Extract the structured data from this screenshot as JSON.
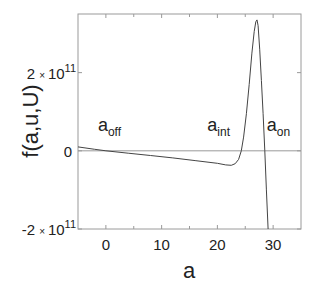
{
  "chart_data": {
    "type": "line",
    "title": "",
    "xlabel": "a",
    "ylabel": "f(a,u,U)",
    "xlim": [
      -5,
      35
    ],
    "ylim": [
      -200000000000.0,
      350000000000.0
    ],
    "grid": false,
    "x_ticks": [
      {
        "value": 0,
        "label": "0"
      },
      {
        "value": 10,
        "label": "10"
      },
      {
        "value": 20,
        "label": "20"
      },
      {
        "value": 30,
        "label": "30"
      }
    ],
    "x_minor_ticks": [
      5,
      15,
      25
    ],
    "y_ticks": [
      {
        "value": 200000000000.0,
        "mantissa": "2",
        "times": "×",
        "base": "10",
        "exp": "11"
      },
      {
        "value": 0,
        "mantissa": "0",
        "times": "",
        "base": "",
        "exp": ""
      },
      {
        "value": -200000000000.0,
        "mantissa": "-2",
        "times": "×",
        "base": "10",
        "exp": "11"
      }
    ],
    "zero_line": true,
    "series": [
      {
        "name": "f(a,u,U)",
        "color": "#444444",
        "x": [
          -5,
          -2,
          0,
          4,
          8,
          12,
          16,
          20,
          21.5,
          22.5,
          23.2,
          23.8,
          24.3,
          24.7,
          25.2,
          25.7,
          26.2,
          26.6,
          26.9,
          27.1,
          27.3,
          27.6,
          27.9,
          28.2,
          28.5,
          28.8,
          29.1
        ],
        "y": [
          10000000000.0,
          4000000000.0,
          0.0,
          -6000000000.0,
          -12000000000.0,
          -18000000000.0,
          -25000000000.0,
          -32000000000.0,
          -36000000000.0,
          -37000000000.0,
          -33000000000.0,
          -22000000000.0,
          0.0,
          35000000000.0,
          95000000000.0,
          170000000000.0,
          250000000000.0,
          305000000000.0,
          330000000000.0,
          335000000000.0,
          320000000000.0,
          260000000000.0,
          180000000000.0,
          95000000000.0,
          0.0,
          -100000000000.0,
          -200000000000.0
        ]
      }
    ],
    "annotations": [
      {
        "base": "a",
        "sub": "off",
        "x": 0,
        "y": 0
      },
      {
        "base": "a",
        "sub": "int",
        "x": 24.3,
        "y": 0
      },
      {
        "base": "a",
        "sub": "on",
        "x": 28.5,
        "y": 0
      }
    ]
  }
}
